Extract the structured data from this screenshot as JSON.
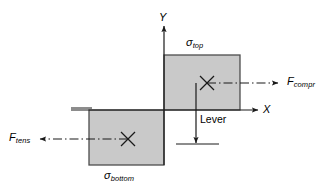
{
  "diagram": {
    "colors": {
      "rect_fill": "#c9c9c9",
      "rect_stroke": "#4d4d4d",
      "line": "#1a1a1a",
      "background": "#ffffff"
    },
    "axes": {
      "y_label": "Y",
      "x_label": "X",
      "origin_x": 164,
      "origin_y": 110
    },
    "rectangles": [
      {
        "name": "top-stress-block",
        "label": "σ",
        "label_sub": "top",
        "x": 164,
        "y": 55,
        "width": 76,
        "height": 55
      },
      {
        "name": "bottom-stress-block",
        "label": "σ",
        "label_sub": "bottom",
        "x": 89,
        "y": 110,
        "width": 75,
        "height": 55
      }
    ],
    "forces": [
      {
        "name": "compression-force",
        "label": "F",
        "label_sub": "compr",
        "direction": "right"
      },
      {
        "name": "tension-force",
        "label": "F",
        "label_sub": "tens",
        "direction": "left"
      }
    ],
    "dimension": {
      "name": "lever-arm",
      "label": "Lever"
    },
    "centroid_markers": [
      {
        "name": "top-centroid-marker",
        "cx": 207,
        "cy": 83
      },
      {
        "name": "bottom-centroid-marker",
        "cx": 128,
        "cy": 139
      }
    ]
  }
}
